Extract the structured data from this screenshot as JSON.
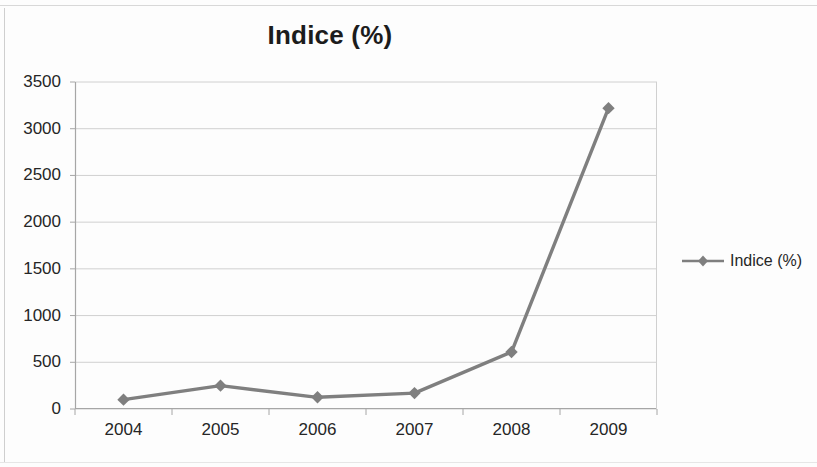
{
  "chart_data": {
    "type": "line",
    "title": "Indice (%)",
    "xlabel": "",
    "ylabel": "",
    "categories": [
      "2004",
      "2005",
      "2006",
      "2007",
      "2008",
      "2009"
    ],
    "series": [
      {
        "name": "Indice (%)",
        "values": [
          100,
          250,
          125,
          170,
          610,
          3220
        ],
        "color": "#7f7f7f",
        "marker": "diamond"
      }
    ],
    "ylim": [
      0,
      3500
    ],
    "yticks": [
      0,
      500,
      1000,
      1500,
      2000,
      2500,
      3000,
      3500
    ],
    "ytick_labels": [
      "0",
      "500",
      "1000",
      "1500",
      "2000",
      "2500",
      "3000",
      "3500"
    ],
    "grid": "horizontal",
    "legend_position": "right",
    "legend_entries": [
      "Indice (%)"
    ]
  },
  "legend": {
    "marker_icon": "diamond-marker-icon",
    "label": "Indice (%)"
  },
  "colors": {
    "series": "#7f7f7f",
    "grid": "#d0d0d0",
    "axis": "#a6a6a6",
    "text": "#262626",
    "background": "#fdfdfd"
  }
}
